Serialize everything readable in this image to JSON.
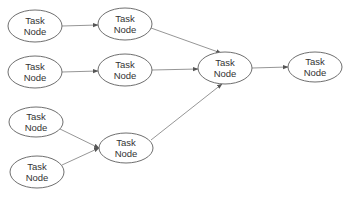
{
  "diagram": {
    "type": "directed-graph",
    "node_label_line1": "Task",
    "node_label_line2": "Node",
    "colors": {
      "node_stroke": "#6f6f6f",
      "node_fill": "#ffffff",
      "edge": "#8a8a8a",
      "text": "#333333",
      "background": "#ffffff"
    },
    "nodes": [
      {
        "id": "n1",
        "label": [
          "Task",
          "Node"
        ],
        "cx": 35,
        "cy": 26,
        "rx": 27,
        "ry": 16
      },
      {
        "id": "n2",
        "label": [
          "Task",
          "Node"
        ],
        "cx": 125,
        "cy": 24,
        "rx": 27,
        "ry": 16
      },
      {
        "id": "n3",
        "label": [
          "Task",
          "Node"
        ],
        "cx": 35,
        "cy": 72,
        "rx": 27,
        "ry": 16
      },
      {
        "id": "n4",
        "label": [
          "Task",
          "Node"
        ],
        "cx": 125,
        "cy": 70,
        "rx": 27,
        "ry": 16
      },
      {
        "id": "n5",
        "label": [
          "Task",
          "Node"
        ],
        "cx": 36,
        "cy": 122,
        "rx": 27,
        "ry": 15
      },
      {
        "id": "n6",
        "label": [
          "Task",
          "Node"
        ],
        "cx": 37,
        "cy": 172,
        "rx": 27,
        "ry": 16
      },
      {
        "id": "n7",
        "label": [
          "Task",
          "Node"
        ],
        "cx": 126,
        "cy": 148,
        "rx": 27,
        "ry": 15
      },
      {
        "id": "n8",
        "label": [
          "Task",
          "Node"
        ],
        "cx": 225,
        "cy": 68,
        "rx": 27,
        "ry": 16
      },
      {
        "id": "n9",
        "label": [
          "Task",
          "Node"
        ],
        "cx": 315,
        "cy": 67,
        "rx": 27,
        "ry": 15
      }
    ],
    "edges": [
      {
        "from": "n1",
        "to": "n2",
        "x1": 62,
        "y1": 26,
        "x2": 98,
        "y2": 25
      },
      {
        "from": "n3",
        "to": "n4",
        "x1": 62,
        "y1": 72,
        "x2": 98,
        "y2": 71
      },
      {
        "from": "n5",
        "to": "n7",
        "x1": 60,
        "y1": 129,
        "x2": 99,
        "y2": 148
      },
      {
        "from": "n6",
        "to": "n7",
        "x1": 62,
        "y1": 165,
        "x2": 99,
        "y2": 148
      },
      {
        "from": "n2",
        "to": "n8",
        "x1": 151,
        "y1": 28,
        "x2": 221,
        "y2": 53
      },
      {
        "from": "n4",
        "to": "n8",
        "x1": 152,
        "y1": 70,
        "x2": 198,
        "y2": 69
      },
      {
        "from": "n7",
        "to": "n8",
        "x1": 151,
        "y1": 140,
        "x2": 222,
        "y2": 84
      },
      {
        "from": "n8",
        "to": "n9",
        "x1": 252,
        "y1": 68,
        "x2": 288,
        "y2": 67
      }
    ]
  }
}
